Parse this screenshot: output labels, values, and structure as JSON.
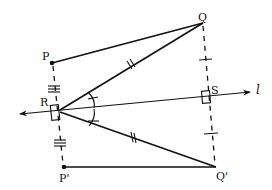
{
  "diagram": {
    "type": "geometry-reflection",
    "points": {
      "P": {
        "label": "P",
        "x": 52,
        "y": 63
      },
      "Q": {
        "label": "Q",
        "x": 203,
        "y": 23
      },
      "R": {
        "label": "R",
        "x": 57,
        "y": 112
      },
      "S": {
        "label": "S",
        "x": 206,
        "y": 98
      },
      "P_prime": {
        "label": "P'",
        "x": 64,
        "y": 167
      },
      "Q_prime": {
        "label": "Q'",
        "x": 216,
        "y": 167
      }
    },
    "line": {
      "label": "l"
    },
    "segments": [
      {
        "from": "P",
        "to": "Q",
        "style": "solid"
      },
      {
        "from": "R",
        "to": "Q",
        "style": "solid",
        "marks": "double-tick"
      },
      {
        "from": "R",
        "to": "Q_prime",
        "style": "solid",
        "marks": "double-tick"
      },
      {
        "from": "P_prime",
        "to": "Q_prime",
        "style": "solid"
      },
      {
        "from": "P",
        "to": "P_prime",
        "style": "dashed",
        "marks": "triple-tick"
      },
      {
        "from": "Q",
        "to": "Q_prime",
        "style": "dashed",
        "marks": "single-tick"
      }
    ],
    "right_angles": [
      "R",
      "S"
    ],
    "equal_angles_at": "R"
  }
}
